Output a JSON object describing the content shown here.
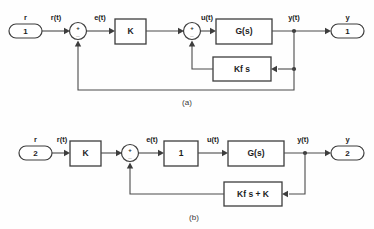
{
  "figure": {
    "type": "control-system-block-diagram",
    "subfigures": [
      {
        "caption": "(a)",
        "input_port": {
          "label": "r",
          "number": "1",
          "signal": "r(t)"
        },
        "output_port": {
          "label": "y",
          "number": "1",
          "signal": "y(t)"
        },
        "summing_junctions": [
          {
            "name": "outer-sum",
            "plus": "+",
            "minus": "_"
          },
          {
            "name": "inner-sum",
            "plus": "+",
            "minus": "_"
          }
        ],
        "blocks": [
          {
            "name": "gain-block",
            "label": "K"
          },
          {
            "name": "plant-block",
            "label": "G(s)"
          },
          {
            "name": "feedback-block",
            "label": "Kf s"
          }
        ],
        "signals": [
          {
            "name": "error-signal",
            "label": "e(t)"
          },
          {
            "name": "control-signal",
            "label": "u(t)"
          }
        ]
      },
      {
        "caption": "(b)",
        "input_port": {
          "label": "r",
          "number": "2",
          "signal": "r(t)"
        },
        "output_port": {
          "label": "y",
          "number": "2",
          "signal": "y(t)"
        },
        "summing_junctions": [
          {
            "name": "main-sum",
            "plus": "+",
            "minus": "_"
          }
        ],
        "blocks": [
          {
            "name": "gain-block",
            "label": "K"
          },
          {
            "name": "unity-block",
            "label": "1"
          },
          {
            "name": "plant-block",
            "label": "G(s)"
          },
          {
            "name": "feedback-block",
            "label": "Kf s + K"
          }
        ],
        "signals": [
          {
            "name": "error-signal",
            "label": "e(t)"
          },
          {
            "name": "control-signal",
            "label": "u(t)"
          }
        ]
      }
    ],
    "colors": {
      "line": "#4a4a4a",
      "block_stroke": "#3d3d3d",
      "text": "#1d1d1d",
      "background": "#fefefe"
    }
  }
}
